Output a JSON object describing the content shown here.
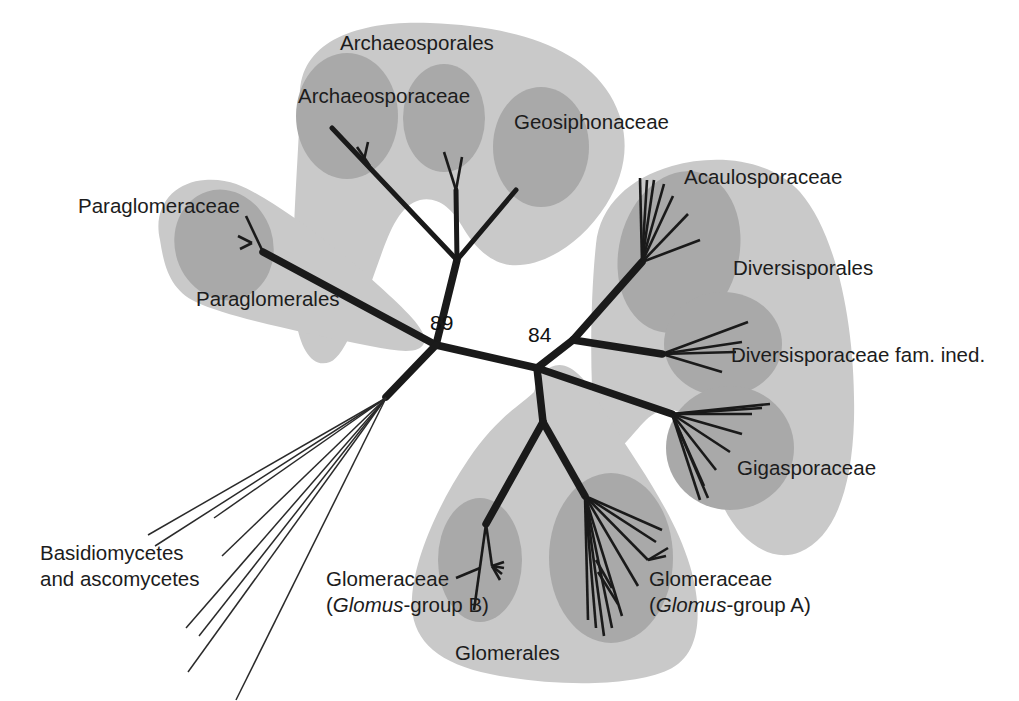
{
  "figure": {
    "type": "unrooted-phylogenetic-tree",
    "background_color": "#ffffff",
    "order_blob_color": "#c9c9c9",
    "family_blob_color": "#a9a9a9",
    "branch_color": "#1a1a1a"
  },
  "labels": {
    "archaeosporales": "Archaeosporales",
    "archaeosporaceae": "Archaeosporaceae",
    "geosiphonaceae": "Geosiphonaceae",
    "paraglomeraceae": "Paraglomeraceae",
    "paraglomerales": "Paraglomerales",
    "acaulosporaceae": "Acaulosporaceae",
    "diversisporales": "Diversisporales",
    "diversisporaceae_fam_ined": "Diversisporaceae fam. ined.",
    "gigasporaceae": "Gigasporaceae",
    "glomerales": "Glomerales",
    "glomeraceae_b_line1": "Glomeraceae",
    "glomeraceae_b_line2_open": "(",
    "glomeraceae_b_line2_italic": "Glomus",
    "glomeraceae_b_line2_rest": "-group B)",
    "glomeraceae_a_line1": "Glomeraceae",
    "glomeraceae_a_line2_open": "(",
    "glomeraceae_a_line2_italic": "Glomus",
    "glomeraceae_a_line2_rest": "-group A)",
    "outgroup_line1": "Basidiomycetes",
    "outgroup_line2": "and ascomycetes"
  },
  "bootstrap": {
    "node_left": "89",
    "node_right": "84"
  },
  "clades": {
    "orders": [
      {
        "name": "Archaeosporales",
        "families": [
          "Archaeosporaceae",
          "Geosiphonaceae"
        ]
      },
      {
        "name": "Paraglomerales",
        "families": [
          "Paraglomeraceae"
        ]
      },
      {
        "name": "Diversisporales",
        "families": [
          "Acaulosporaceae",
          "Diversisporaceae fam. ined.",
          "Gigasporaceae"
        ]
      },
      {
        "name": "Glomerales",
        "families": [
          "Glomeraceae (Glomus-group B)",
          "Glomeraceae (Glomus-group A)"
        ]
      }
    ],
    "outgroup": "Basidiomycetes and ascomycetes"
  }
}
